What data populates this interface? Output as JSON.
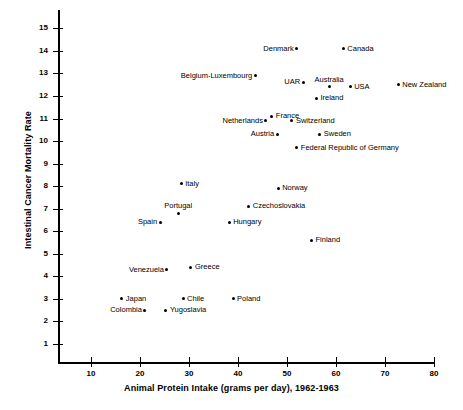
{
  "chart_data": {
    "type": "scatter",
    "title": "",
    "xlabel": "Animal Protein Intake (grams per day), 1962-1963",
    "ylabel": "Intestinal Cancer Mortality Rate",
    "xlim": [
      0,
      80
    ],
    "ylim": [
      0,
      15
    ],
    "xticks": [
      10,
      20,
      30,
      40,
      50,
      60,
      70,
      80
    ],
    "yticks": [
      1,
      2,
      3,
      4,
      5,
      6,
      7,
      8,
      9,
      10,
      11,
      12,
      13,
      14,
      15
    ],
    "grid": false,
    "legend": "none",
    "points": [
      {
        "label": "Denmark",
        "x": 52.0,
        "y": 14.1,
        "anchor": "left"
      },
      {
        "label": "Canada",
        "x": 61.5,
        "y": 14.1,
        "anchor": "right"
      },
      {
        "label": "Belgium-Luxembourg",
        "x": 43.5,
        "y": 12.9,
        "anchor": "left"
      },
      {
        "label": "UAR",
        "x": 53.3,
        "y": 12.6,
        "anchor": "left"
      },
      {
        "label": "Australia",
        "x": 58.6,
        "y": 12.4,
        "anchor": "above"
      },
      {
        "label": "USA",
        "x": 62.9,
        "y": 12.4,
        "anchor": "right"
      },
      {
        "label": "New Zealand",
        "x": 72.7,
        "y": 12.5,
        "anchor": "right"
      },
      {
        "label": "Ireland",
        "x": 56.0,
        "y": 11.9,
        "anchor": "right"
      },
      {
        "label": "France",
        "x": 46.9,
        "y": 11.1,
        "anchor": "right"
      },
      {
        "label": "Netherlands",
        "x": 45.7,
        "y": 10.9,
        "anchor": "left"
      },
      {
        "label": "Switzerland",
        "x": 51.0,
        "y": 10.9,
        "anchor": "right"
      },
      {
        "label": "Austria",
        "x": 48.0,
        "y": 10.3,
        "anchor": "left"
      },
      {
        "label": "Sweden",
        "x": 56.7,
        "y": 10.3,
        "anchor": "right"
      },
      {
        "label": "Federal Republic of Germany",
        "x": 52.0,
        "y": 9.7,
        "anchor": "right"
      },
      {
        "label": "Italy",
        "x": 28.4,
        "y": 8.1,
        "anchor": "right"
      },
      {
        "label": "Norway",
        "x": 48.2,
        "y": 7.9,
        "anchor": "right"
      },
      {
        "label": "Portugal",
        "x": 27.8,
        "y": 6.8,
        "anchor": "above"
      },
      {
        "label": "Czechoslovakia",
        "x": 42.2,
        "y": 7.1,
        "anchor": "right"
      },
      {
        "label": "Spain",
        "x": 24.1,
        "y": 6.4,
        "anchor": "left"
      },
      {
        "label": "Hungary",
        "x": 38.2,
        "y": 6.4,
        "anchor": "right"
      },
      {
        "label": "Finland",
        "x": 55.0,
        "y": 5.6,
        "anchor": "right"
      },
      {
        "label": "Venezuela",
        "x": 25.5,
        "y": 4.3,
        "anchor": "left"
      },
      {
        "label": "Greece",
        "x": 30.4,
        "y": 4.4,
        "anchor": "right"
      },
      {
        "label": "Japan",
        "x": 16.3,
        "y": 3.0,
        "anchor": "right"
      },
      {
        "label": "Chile",
        "x": 28.8,
        "y": 3.0,
        "anchor": "right"
      },
      {
        "label": "Poland",
        "x": 39.0,
        "y": 3.0,
        "anchor": "right"
      },
      {
        "label": "Colombia",
        "x": 21.0,
        "y": 2.5,
        "anchor": "left"
      },
      {
        "label": "Yugoslavia",
        "x": 25.3,
        "y": 2.5,
        "anchor": "right"
      }
    ]
  },
  "colors": {
    "axis": "#000000",
    "point": "#000000",
    "background": "#ffffff"
  }
}
